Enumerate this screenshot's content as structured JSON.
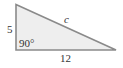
{
  "diagram": {
    "type": "right-triangle",
    "labels": {
      "vertical_leg": "5",
      "horizontal_leg": "12",
      "hypotenuse": "c",
      "right_angle": "90°"
    },
    "colors": {
      "stroke": "#8a8a8a",
      "fill": "#eeeeee",
      "text": "#333333"
    }
  }
}
